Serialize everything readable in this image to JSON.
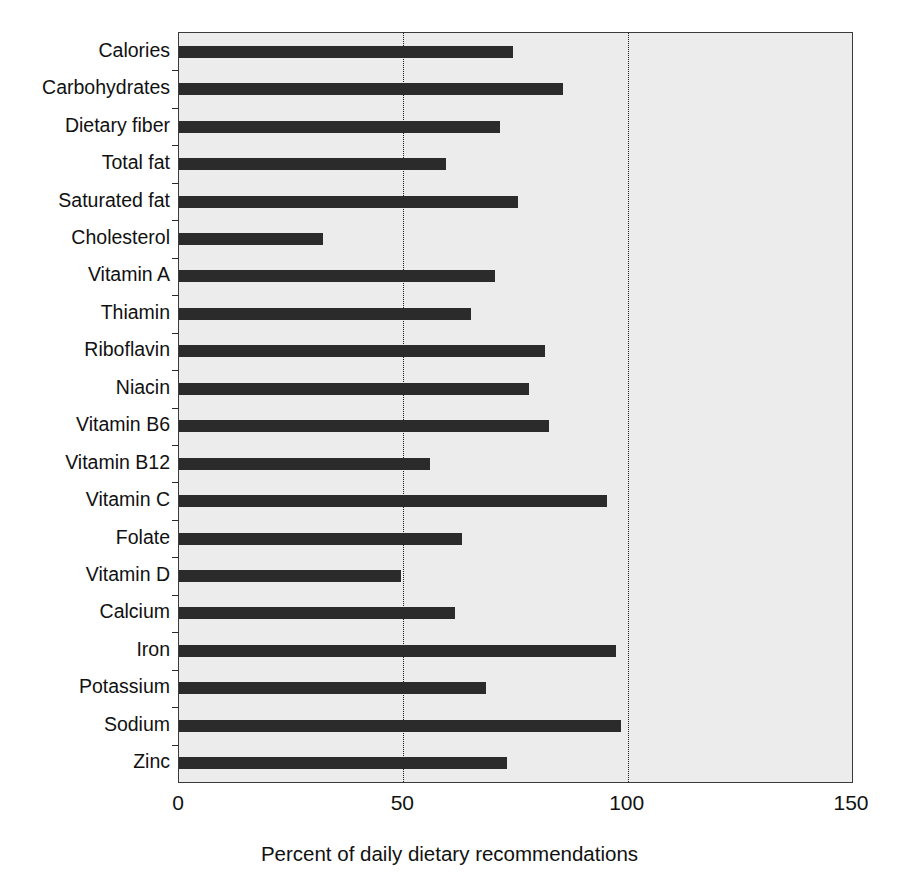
{
  "chart_data": {
    "type": "bar",
    "orientation": "horizontal",
    "title": "",
    "subtitle": "",
    "xlabel": "Percent of daily dietary recommendations",
    "ylabel": "",
    "xlim": [
      0,
      150
    ],
    "xticks": [
      0,
      50,
      100,
      150
    ],
    "xtick_labels": [
      "0",
      "50",
      "100",
      "150"
    ],
    "grid": "vertical dotted gridlines at 50 and 100",
    "gridlines": [
      50,
      100
    ],
    "legend": null,
    "legend_position": "none",
    "plot_background": "#ececec",
    "bar_color": "#2b2b2b",
    "axis_color": "#3b3b3b",
    "categories": [
      "Calories",
      "Carbohydrates",
      "Dietary fiber",
      "Total fat",
      "Saturated fat",
      "Cholesterol",
      "Vitamin A",
      "Thiamin",
      "Riboflavin",
      "Niacin",
      "Vitamin B6",
      "Vitamin B12",
      "Vitamin C",
      "Folate",
      "Vitamin D",
      "Calcium",
      "Iron",
      "Potassium",
      "Sodium",
      "Zinc"
    ],
    "values": [
      74.5,
      85.5,
      71.5,
      59.5,
      75.5,
      32.0,
      70.5,
      65.0,
      81.5,
      78.0,
      82.5,
      56.0,
      95.5,
      63.0,
      49.5,
      61.5,
      97.5,
      68.5,
      98.5,
      73.0
    ],
    "units": "percent"
  },
  "axis": {
    "x_title": "Percent of daily dietary recommendations",
    "tick_0": "0",
    "tick_50": "50",
    "tick_100": "100",
    "tick_150": "150"
  }
}
